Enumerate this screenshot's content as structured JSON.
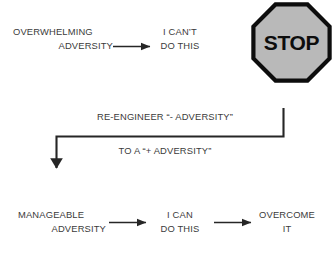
{
  "diagram": {
    "colors": {
      "text": "#3b3b3b",
      "line": "#262626",
      "sign_fill": "#b9b9b9",
      "sign_border": "#0d0d0d",
      "sign_text": "#0d0d0d",
      "background": "#ffffff"
    },
    "top_row": {
      "source": {
        "line1": "OVERWHELMING",
        "line2": "ADVERSITY"
      },
      "result": {
        "line1": "I CAN’T",
        "line2": "DO THIS"
      },
      "sign": {
        "label": "STOP",
        "shape": "octagon"
      }
    },
    "connector": {
      "label_line1": "RE-ENGINEER “- ADVERSITY”",
      "label_line2": "TO A “+ ADVERSITY”"
    },
    "bottom_row": {
      "source": {
        "line1": "MANAGEABLE",
        "line2": "ADVERSITY"
      },
      "middle": {
        "line1": "I CAN",
        "line2": "DO THIS"
      },
      "result": {
        "line1": "OVERCOME",
        "line2": "IT"
      }
    }
  }
}
